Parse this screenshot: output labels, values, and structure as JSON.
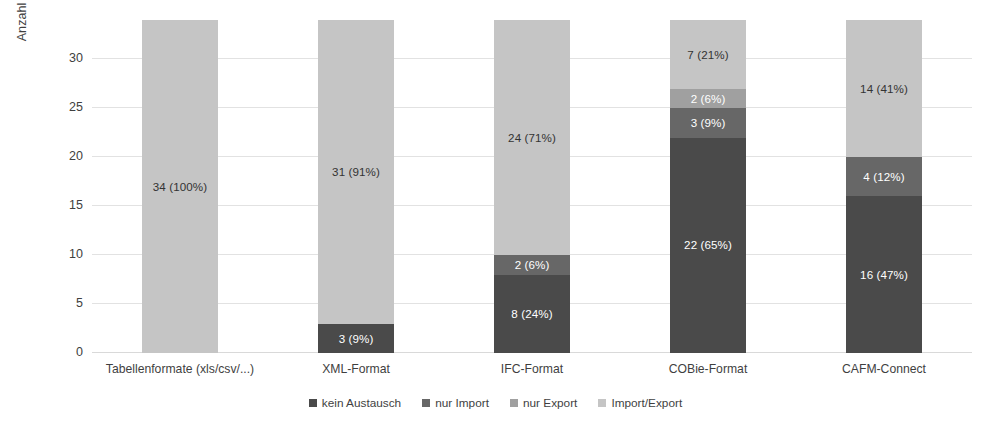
{
  "chart_data": {
    "type": "bar",
    "subtype": "stacked-bar",
    "title": "",
    "xlabel": "",
    "ylabel": "Anzahl (Anteil) der Anwendungen",
    "ylim": [
      0,
      34
    ],
    "yticks": [
      0,
      5,
      10,
      15,
      20,
      25,
      30
    ],
    "ytick_labels": [
      "0",
      "5",
      "10",
      "15",
      "20",
      "25",
      "30"
    ],
    "grid": true,
    "legend_position": "bottom",
    "total": 34,
    "categories": [
      "Tabellenformate (xls/csv/...)",
      "XML-Format",
      "IFC-Format",
      "COBie-Format",
      "CAFM-Connect"
    ],
    "series": [
      {
        "name": "kein Austausch",
        "color": "#4a4a4a",
        "label_color": "#ffffff",
        "values": [
          0,
          3,
          8,
          22,
          16
        ],
        "percents": [
          "",
          "9%",
          "24%",
          "65%",
          "47%"
        ],
        "labels": [
          "",
          "3 (9%)",
          "8 (24%)",
          "22 (65%)",
          "16 (47%)"
        ]
      },
      {
        "name": "nur Import",
        "color": "#676767",
        "label_color": "#ffffff",
        "values": [
          0,
          0,
          2,
          3,
          4
        ],
        "percents": [
          "",
          "",
          "6%",
          "9%",
          "12%"
        ],
        "labels": [
          "",
          "",
          "2 (6%)",
          "3 (9%)",
          "4 (12%)"
        ]
      },
      {
        "name": "nur Export",
        "color": "#a0a0a0",
        "label_color": "#ffffff",
        "values": [
          0,
          0,
          0,
          2,
          0
        ],
        "percents": [
          "",
          "",
          "",
          "6%",
          ""
        ],
        "labels": [
          "",
          "",
          "",
          "2 (6%)",
          ""
        ]
      },
      {
        "name": "Import/Export",
        "color": "#c5c5c5",
        "label_color": "#333333",
        "values": [
          34,
          31,
          24,
          7,
          14
        ],
        "percents": [
          "100%",
          "91%",
          "71%",
          "21%",
          "41%"
        ],
        "labels": [
          "34 (100%)",
          "31 (91%)",
          "24 (71%)",
          "7 (21%)",
          "14 (41%)"
        ]
      }
    ]
  },
  "legend": {
    "items": [
      {
        "label": "kein Austausch",
        "color": "#4a4a4a"
      },
      {
        "label": "nur Import",
        "color": "#676767"
      },
      {
        "label": "nur Export",
        "color": "#a0a0a0"
      },
      {
        "label": "Import/Export",
        "color": "#c5c5c5"
      }
    ]
  }
}
